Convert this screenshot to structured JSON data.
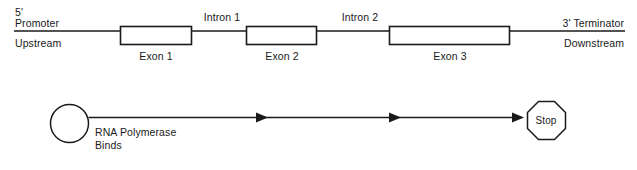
{
  "diagram": {
    "colors": {
      "stroke": "#1a1a1a",
      "fill": "#ffffff",
      "background": "#ffffff"
    },
    "gene_track": {
      "left_labels": {
        "prime_end": "5'",
        "region": "Promoter",
        "direction": "Upstream"
      },
      "right_labels": {
        "prime_end_region": "3' Terminator",
        "direction": "Downstream"
      },
      "introns": [
        {
          "label": "Intron 1"
        },
        {
          "label": "Intron 2"
        }
      ],
      "exons": [
        {
          "label": "Exon 1"
        },
        {
          "label": "Exon 2"
        },
        {
          "label": "Exon 3"
        }
      ]
    },
    "transcription_track": {
      "polymerase": {
        "shape": "circle",
        "label_line1": "RNA Polymerase",
        "label_line2": "Binds"
      },
      "arrow_count": 3,
      "terminator": {
        "shape": "octagon",
        "label": "Stop"
      }
    }
  }
}
